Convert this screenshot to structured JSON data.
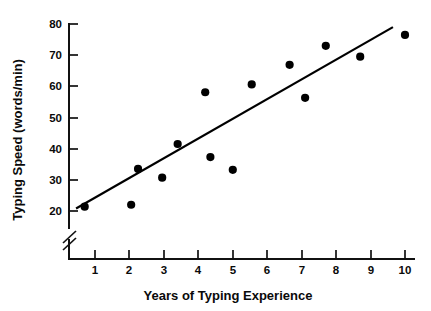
{
  "chart_data": {
    "type": "scatter",
    "title": "",
    "xlabel": "Years of Typing Experience",
    "ylabel": "Typing Speed (words/min)",
    "xlim": [
      0.25,
      10.4
    ],
    "ylim": [
      17.0,
      80.0
    ],
    "xticks": [
      1,
      2,
      3,
      4,
      5,
      6,
      7,
      8,
      9,
      10
    ],
    "xtick_labels": [
      "1",
      "2",
      "3",
      "4",
      "5",
      "6",
      "7",
      "8",
      "9",
      "10"
    ],
    "yticks": [
      20,
      30,
      40,
      50,
      60,
      70,
      80
    ],
    "ytick_labels": [
      "20",
      "30",
      "40",
      "50",
      "60",
      "70",
      "80"
    ],
    "y_axis_break": true,
    "y_axis_break_note": "double slash break between origin and 20",
    "grid": false,
    "legend": false,
    "x": [
      0.7,
      2.05,
      2.25,
      2.95,
      3.4,
      4.2,
      4.35,
      5.0,
      5.55,
      6.65,
      7.1,
      7.7,
      8.7,
      10.0
    ],
    "y": [
      21.4,
      22.0,
      33.5,
      30.7,
      41.5,
      58.1,
      37.3,
      33.2,
      60.6,
      66.9,
      56.3,
      73.0,
      69.5,
      76.5
    ],
    "points": [
      {
        "x": 0.7,
        "y": 21.4
      },
      {
        "x": 2.05,
        "y": 22.0
      },
      {
        "x": 2.25,
        "y": 33.5
      },
      {
        "x": 2.95,
        "y": 30.7
      },
      {
        "x": 3.4,
        "y": 41.5
      },
      {
        "x": 4.2,
        "y": 58.1
      },
      {
        "x": 4.35,
        "y": 37.3
      },
      {
        "x": 5.0,
        "y": 33.2
      },
      {
        "x": 5.55,
        "y": 60.6
      },
      {
        "x": 6.65,
        "y": 66.9
      },
      {
        "x": 7.1,
        "y": 56.3
      },
      {
        "x": 7.7,
        "y": 73.0
      },
      {
        "x": 8.7,
        "y": 69.5
      },
      {
        "x": 10.0,
        "y": 76.5
      }
    ],
    "marker": "filled-circle",
    "marker_color": "#000000",
    "marker_size": 4.1,
    "trendline": {
      "type": "linear-fit",
      "color": "#000000",
      "x_start": 0.45,
      "y_start": 20.8,
      "x_end": 9.65,
      "y_end": 79.0
    },
    "axis_color": "#111111"
  }
}
